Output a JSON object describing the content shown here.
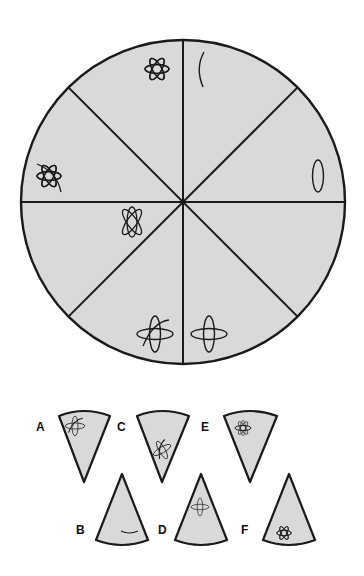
{
  "puzzle": {
    "type": "circle-sequence",
    "fill_color": "#d9d9d9",
    "stroke_color": "#1a1a1a",
    "sectors": [
      {
        "position": "top-left",
        "symbol": "atom-3-orbits-large"
      },
      {
        "position": "top-right",
        "symbol": "single-arc"
      },
      {
        "position": "right-upper",
        "symbol": "single-vertical-ellipse"
      },
      {
        "position": "right-lower",
        "symbol": "missing"
      },
      {
        "position": "bottom-right",
        "symbol": "cross-two-ellipses"
      },
      {
        "position": "bottom-left",
        "symbol": "cross-two-ellipses-plus-arc"
      },
      {
        "position": "left-lower",
        "symbol": "atom-3-orbits-rotated"
      },
      {
        "position": "left-upper",
        "symbol": "atom-3-orbits-plus-arc"
      }
    ]
  },
  "options": [
    {
      "label": "A",
      "symbol": "cross-ellipses-with-arc",
      "orientation": "point-down"
    },
    {
      "label": "B",
      "symbol": "single-arc",
      "orientation": "point-up"
    },
    {
      "label": "C",
      "symbol": "cross-ellipses-with-arc",
      "orientation": "point-down"
    },
    {
      "label": "D",
      "symbol": "cross-two-ellipses",
      "orientation": "point-up"
    },
    {
      "label": "E",
      "symbol": "atom-3-orbits",
      "orientation": "point-down"
    },
    {
      "label": "F",
      "symbol": "atom-3-orbits-large",
      "orientation": "point-up"
    }
  ]
}
